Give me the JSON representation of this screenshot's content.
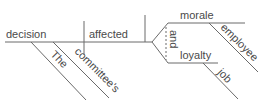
{
  "diagram": {
    "type": "sentence-diagram",
    "sentence": "The committee's decision affected employee morale and job loyalty",
    "subject": "decision",
    "verb": "affected",
    "conjunction": "and",
    "objects": [
      "morale",
      "loyalty"
    ],
    "modifiers": {
      "decision": [
        "The",
        "committee's"
      ],
      "morale": [
        "employee"
      ],
      "loyalty": [
        "job"
      ]
    },
    "words": {
      "subject": "decision",
      "verb": "affected",
      "object1": "morale",
      "object2": "loyalty",
      "conj": "and",
      "mod_the": "The",
      "mod_committee": "committee's",
      "mod_employee": "employee",
      "mod_job": "job"
    },
    "line_color": "#6a6a6a",
    "text_color": "#4a4a4a"
  }
}
